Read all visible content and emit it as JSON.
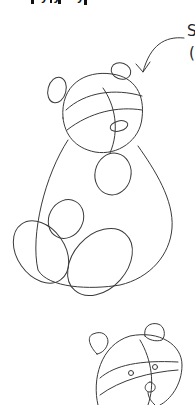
{
  "page": {
    "title_fragment": "ʹ ʸʸ ʸ ʹ",
    "side_note_fragment_1": "S",
    "side_note_fragment_2": "(",
    "background": "#ffffff",
    "stroke_color": "#3a3a3a"
  },
  "figures": [
    {
      "name": "bear-step-sketch-large",
      "parts": [
        "head",
        "left-ear",
        "right-ear",
        "head-guide-lines",
        "muzzle",
        "body",
        "belly-spot",
        "arm",
        "left-foot",
        "right-foot"
      ]
    },
    {
      "name": "bear-step-sketch-small",
      "parts": [
        "head",
        "left-ear",
        "right-ear",
        "eyes",
        "muzzle",
        "guide-lines"
      ]
    }
  ],
  "annotations": [
    {
      "name": "pointer-arrow",
      "direction": "down-left"
    }
  ]
}
